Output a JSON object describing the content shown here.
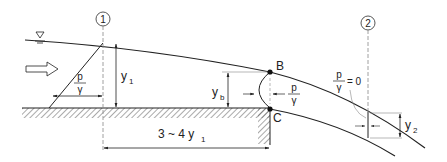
{
  "diagram": {
    "type": "hydraulic free overfall (drop) flow profile",
    "sections": [
      {
        "id": "section-1",
        "label": "1"
      },
      {
        "id": "section-2",
        "label": "2"
      }
    ],
    "points": {
      "brink_top": "B",
      "brink_bottom": "C"
    },
    "labels": {
      "y1_main": "y",
      "y1_sub": "1",
      "yb_main": "y",
      "yb_sub": "b",
      "y2_main": "y",
      "y2_sub": "2",
      "p_over_gamma_num": "p",
      "p_over_gamma_den": "γ",
      "p_over_gamma_zero_rhs": "= 0",
      "distance_prefix": "3 ~ 4 y",
      "distance_sub": "1"
    },
    "symbols": {
      "water_surface": "water-surface-triangle-symbol",
      "flow_direction": "hollow-right-arrow"
    },
    "colors": {
      "line": "#222222",
      "dashed": "#888888",
      "hatch": "#555555",
      "background": "#ffffff"
    }
  }
}
